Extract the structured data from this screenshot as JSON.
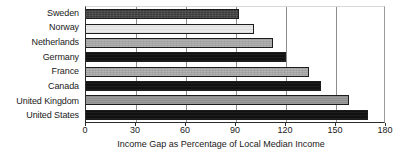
{
  "chart_data": {
    "type": "bar",
    "orientation": "horizontal",
    "title": "",
    "xlabel": "Income Gap as Percentage of Local Median Income",
    "ylabel": "",
    "categories": [
      "Sweden",
      "Norway",
      "Netherlands",
      "Germany",
      "France",
      "Canada",
      "United Kingdom",
      "United States"
    ],
    "values": [
      92,
      101,
      112,
      120,
      134,
      141,
      158,
      169
    ],
    "xlim": [
      0,
      180
    ],
    "xticks": [
      0,
      30,
      60,
      90,
      120,
      150,
      180
    ],
    "xtick_labels": [
      "0",
      "30",
      "60",
      "90",
      "120",
      "150",
      "180"
    ],
    "grid": "vertical-at-ticks",
    "legend": "none",
    "bar_fills": [
      "#3a3a3a",
      "#e9e9e9",
      "#a5a5a5",
      "#111111",
      "#8e8e8e",
      "#2b2b2b",
      "#8e8e8e",
      "#2b2b2b"
    ],
    "bar_edge_color": "#1c1c1c",
    "axis_color": "#2b2b2b",
    "background": "#ffffff"
  }
}
